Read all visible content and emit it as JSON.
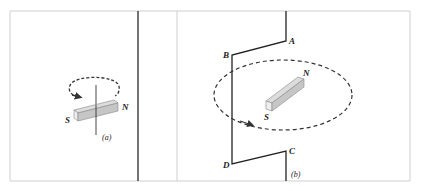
{
  "figure": {
    "panel_a": {
      "caption": "(a)",
      "magnet": {
        "south_label": "S",
        "north_label": "N"
      },
      "rotation": "clockwise-arrow"
    },
    "panel_b": {
      "caption": "(b)",
      "magnet": {
        "south_label": "S",
        "north_label": "N"
      },
      "circuit_points": [
        "A",
        "B",
        "C",
        "D"
      ],
      "rotation": "orbit-arrow"
    },
    "colors": {
      "frame": "#cccccc",
      "divider": "#444444",
      "wire": "#222222",
      "magnet_top": "#d8d8d8",
      "magnet_front": "#c4c4c4",
      "magnet_side": "#e8e8e8",
      "dashed": "#333333"
    }
  }
}
